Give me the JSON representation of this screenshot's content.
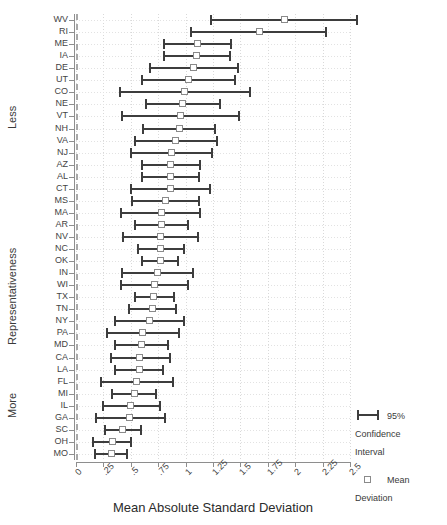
{
  "chart": {
    "title": "",
    "x_axis_title": "Mean Absolute Standard Deviation",
    "y_axis_title": "Representativeness",
    "y_group_top": "Less",
    "y_group_bottom": "More"
  },
  "legend": {
    "items": [
      {
        "glyph": "error-bar-icon",
        "label": "95%\nConfidence\nInterval",
        "line1": "95%",
        "line2": "Confidence",
        "line3": "Interval"
      },
      {
        "glyph": "open-square-icon",
        "label": "Mean\nDeviation",
        "line1": "Mean",
        "line2": "Deviation",
        "line3": ""
      }
    ]
  },
  "chart_data": {
    "type": "scatter",
    "subtype": "dot-and-whisker",
    "title": "",
    "xlabel": "Mean Absolute Standard Deviation",
    "ylabel": "Representativeness",
    "xlim": [
      0,
      2.5
    ],
    "xticks": [
      0,
      0.25,
      0.5,
      0.75,
      1,
      1.25,
      1.5,
      1.75,
      2,
      2.25,
      2.5
    ],
    "xticklabels": [
      "0",
      ".25",
      ".5",
      ".75",
      "1",
      "1.25",
      "1.5",
      "1.75",
      "2",
      "2.25",
      "2.5"
    ],
    "grid": true,
    "reference_line": 0,
    "legend_position": "right",
    "colors": {
      "bar": "#3d3d3d",
      "marker_edge": "#8a8a8a",
      "grid": "#d9d9d9",
      "axis": "#8e8e8e",
      "reference_line": "#a8a8a8"
    },
    "series_name": "Mean Deviation",
    "error_name": "95% Confidence Interval",
    "categories": [
      "WV",
      "RI",
      "ME",
      "IA",
      "DE",
      "UT",
      "CO",
      "NE",
      "VT",
      "NH",
      "VA",
      "NJ",
      "AZ",
      "AL",
      "CT",
      "MS",
      "MA",
      "AR",
      "NV",
      "NC",
      "OK",
      "IN",
      "WI",
      "TX",
      "TN",
      "NY",
      "PA",
      "MD",
      "CA",
      "LA",
      "FL",
      "MI",
      "IL",
      "GA",
      "SC",
      "OH",
      "MO"
    ],
    "points": [
      {
        "label": "WV",
        "mean": 1.9,
        "low": 1.22,
        "high": 2.57
      },
      {
        "label": "RI",
        "mean": 1.67,
        "low": 1.04,
        "high": 2.29
      },
      {
        "label": "ME",
        "mean": 1.11,
        "low": 0.79,
        "high": 1.42
      },
      {
        "label": "IA",
        "mean": 1.1,
        "low": 0.79,
        "high": 1.41
      },
      {
        "label": "DE",
        "mean": 1.07,
        "low": 0.67,
        "high": 1.49
      },
      {
        "label": "UT",
        "mean": 1.03,
        "low": 0.59,
        "high": 1.46
      },
      {
        "label": "CO",
        "mean": 0.99,
        "low": 0.39,
        "high": 1.6
      },
      {
        "label": "NE",
        "mean": 0.97,
        "low": 0.63,
        "high": 1.32
      },
      {
        "label": "VT",
        "mean": 0.95,
        "low": 0.41,
        "high": 1.5
      },
      {
        "label": "NH",
        "mean": 0.94,
        "low": 0.6,
        "high": 1.28
      },
      {
        "label": "VA",
        "mean": 0.91,
        "low": 0.53,
        "high": 1.3
      },
      {
        "label": "NJ",
        "mean": 0.87,
        "low": 0.49,
        "high": 1.25
      },
      {
        "label": "AZ",
        "mean": 0.86,
        "low": 0.59,
        "high": 1.14
      },
      {
        "label": "AL",
        "mean": 0.86,
        "low": 0.59,
        "high": 1.13
      },
      {
        "label": "CT",
        "mean": 0.86,
        "low": 0.49,
        "high": 1.23
      },
      {
        "label": "MS",
        "mean": 0.82,
        "low": 0.5,
        "high": 1.13
      },
      {
        "label": "MA",
        "mean": 0.78,
        "low": 0.4,
        "high": 1.14
      },
      {
        "label": "AR",
        "mean": 0.78,
        "low": 0.53,
        "high": 1.03
      },
      {
        "label": "NV",
        "mean": 0.77,
        "low": 0.42,
        "high": 1.12
      },
      {
        "label": "NC",
        "mean": 0.77,
        "low": 0.56,
        "high": 0.99
      },
      {
        "label": "OK",
        "mean": 0.77,
        "low": 0.59,
        "high": 0.94
      },
      {
        "label": "IN",
        "mean": 0.74,
        "low": 0.41,
        "high": 1.08
      },
      {
        "label": "WI",
        "mean": 0.72,
        "low": 0.4,
        "high": 1.03
      },
      {
        "label": "TX",
        "mean": 0.71,
        "low": 0.53,
        "high": 0.9
      },
      {
        "label": "TN",
        "mean": 0.7,
        "low": 0.47,
        "high": 0.92
      },
      {
        "label": "NY",
        "mean": 0.67,
        "low": 0.35,
        "high": 0.99
      },
      {
        "label": "PA",
        "mean": 0.61,
        "low": 0.27,
        "high": 0.95
      },
      {
        "label": "MD",
        "mean": 0.6,
        "low": 0.35,
        "high": 0.85
      },
      {
        "label": "CA",
        "mean": 0.58,
        "low": 0.31,
        "high": 0.87
      },
      {
        "label": "LA",
        "mean": 0.58,
        "low": 0.35,
        "high": 0.8
      },
      {
        "label": "FL",
        "mean": 0.55,
        "low": 0.22,
        "high": 0.89
      },
      {
        "label": "MI",
        "mean": 0.53,
        "low": 0.32,
        "high": 0.74
      },
      {
        "label": "IL",
        "mean": 0.5,
        "low": 0.24,
        "high": 0.78
      },
      {
        "label": "GA",
        "mean": 0.49,
        "low": 0.17,
        "high": 0.82
      },
      {
        "label": "SC",
        "mean": 0.42,
        "low": 0.26,
        "high": 0.6
      },
      {
        "label": "OH",
        "mean": 0.33,
        "low": 0.15,
        "high": 0.51
      },
      {
        "label": "MO",
        "mean": 0.32,
        "low": 0.16,
        "high": 0.47
      }
    ]
  }
}
